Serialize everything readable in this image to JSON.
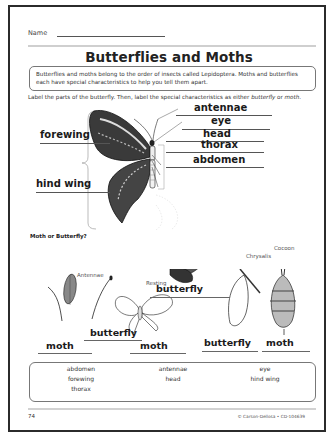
{
  "worksheet": {
    "name_label": "Name",
    "title": "Butterflies and Moths",
    "intro": "Butterflies and moths belong to the order of insects called Lepidoptera. Moths and butterflies each have special characteristics to help you tell them apart.",
    "instructions_pre": "Label the parts of the butterfly. Then, label the special characteristics as either ",
    "instructions_butterfly": "butterfly",
    "instructions_mid": " or ",
    "instructions_moth": "moth",
    "instructions_end": "."
  },
  "butterfly_diagram": {
    "labels": {
      "antennae": "antennae",
      "eye": "eye",
      "head": "head",
      "thorax": "thorax",
      "abdomen": "abdomen",
      "forewing": "forewing",
      "hind_wing": "hind wing"
    },
    "colors": {
      "ink": "#1a1a1a",
      "line": "#555555",
      "bracket": "#aaaaaa"
    }
  },
  "moth_or_butterfly": {
    "heading": "Moth or Butterfly?",
    "captions": {
      "antennae": "Antennae",
      "resting": "Resting",
      "chrysalis": "Chrysalis",
      "cocoon": "Cocoon"
    },
    "answers": {
      "feathery_antenna": "moth",
      "clubbed_antenna": "butterfly",
      "resting_butterfly": "butterfly",
      "spread_moth": "moth",
      "chrysalis": "butterfly",
      "cocoon": "moth"
    }
  },
  "word_bank": {
    "words": [
      "abdomen",
      "antennae",
      "eye",
      "forewing",
      "head",
      "hind wing",
      "thorax"
    ]
  },
  "footer": {
    "page_number": "74",
    "copyright": "© Carson-Dellosa • CD-104639"
  }
}
